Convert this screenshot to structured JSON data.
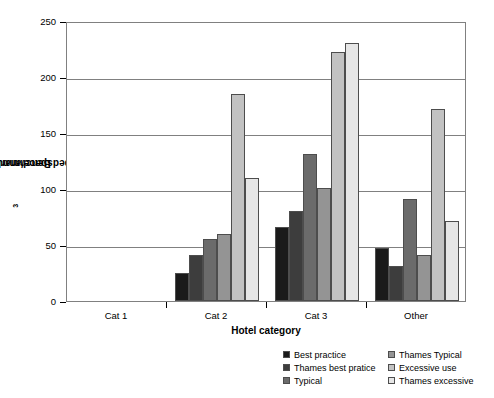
{
  "chart_data": {
    "type": "bar",
    "title": "",
    "xlabel": "Hotel category",
    "ylabel": "Benchmark (m³/bedspace/annum)",
    "ylabel_prefix": "Benchmark (m",
    "ylabel_sup": "3",
    "ylabel_suffix": "/bedspace/annum)",
    "categories": [
      "Cat 1",
      "Cat 2",
      "Cat 3",
      "Other"
    ],
    "ylim": [
      0,
      250
    ],
    "yticks": [
      0,
      50,
      100,
      150,
      200,
      250
    ],
    "ytick_labels": [
      "0",
      "50",
      "100",
      "150",
      "200",
      "250"
    ],
    "grid": true,
    "legend_position": "bottom-right",
    "series": [
      {
        "name": "Best practice",
        "color": "#1a1a1a",
        "values": [
          null,
          25,
          66,
          47
        ]
      },
      {
        "name": "Thames best pratice",
        "color": "#3d3d3d",
        "values": [
          null,
          41,
          80,
          31
        ]
      },
      {
        "name": "Typical",
        "color": "#6b6b6b",
        "values": [
          null,
          55,
          131,
          91
        ]
      },
      {
        "name": "Thames Typical",
        "color": "#949494",
        "values": [
          null,
          60,
          101,
          41
        ]
      },
      {
        "name": "Excessive use",
        "color": "#c2c2c2",
        "values": [
          null,
          185,
          222,
          171
        ]
      },
      {
        "name": "Thames excessive",
        "color": "#e6e6e6",
        "values": [
          null,
          110,
          230,
          71
        ]
      }
    ]
  },
  "legend": {
    "columns": [
      [
        {
          "label": "Best practice",
          "color": "#1a1a1a"
        },
        {
          "label": "Thames best pratice",
          "color": "#3d3d3d"
        },
        {
          "label": "Typical",
          "color": "#6b6b6b"
        }
      ],
      [
        {
          "label": "Thames Typical",
          "color": "#949494"
        },
        {
          "label": "Excessive use",
          "color": "#c2c2c2"
        },
        {
          "label": "Thames excessive",
          "color": "#e6e6e6"
        }
      ]
    ]
  }
}
